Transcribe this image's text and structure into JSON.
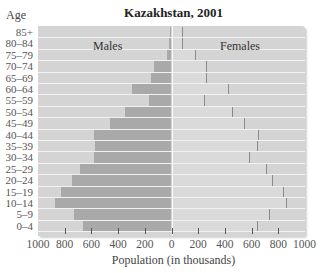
{
  "chart_data": {
    "type": "bar",
    "subtype": "population-pyramid",
    "title": "Kazakhstan, 2001",
    "xlabel": "Population (in thousands)",
    "ylabel": "Age",
    "categories": [
      "85+",
      "80–84",
      "75–79",
      "70–74",
      "65–69",
      "60–64",
      "55–59",
      "50–54",
      "45–49",
      "40–44",
      "35–39",
      "30–34",
      "25–29",
      "20–24",
      "15–19",
      "10–14",
      "5–9",
      "0–4"
    ],
    "series": [
      {
        "name": "Males",
        "values": [
          10,
          20,
          30,
          130,
          150,
          295,
          165,
          350,
          457,
          577,
          572,
          582,
          682,
          744,
          827,
          869,
          734,
          665
        ]
      },
      {
        "name": "Females",
        "values": [
          75,
          75,
          175,
          262,
          255,
          425,
          240,
          452,
          540,
          651,
          640,
          577,
          705,
          752,
          835,
          860,
          727,
          642
        ]
      }
    ],
    "xlim": [
      -1000,
      1000
    ],
    "x_ticks": [
      "1000",
      "800",
      "600",
      "400",
      "200",
      "0",
      "200",
      "400",
      "600",
      "800",
      "1000"
    ],
    "grid": false,
    "legend": "in-plot labels (Males left, Females right)"
  },
  "labels": {
    "title": "Kazakhstan, 2001",
    "age_header": "Age",
    "males": "Males",
    "females": "Females",
    "xlabel": "Population (in thousands)"
  },
  "colors": {
    "panel": "#d4d4d4",
    "males": "#a9a9a9",
    "females": "#dadada",
    "female_edge": "#8a8a8a"
  }
}
